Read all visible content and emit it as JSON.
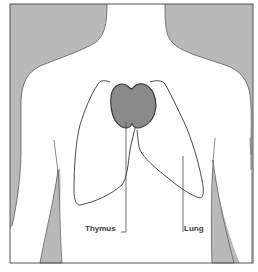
{
  "diagram": {
    "colors": {
      "background_shade": "#b9b9b9",
      "body_fill": "#ffffff",
      "frame_stroke": "#555555",
      "outline_stroke": "#4a4a4a",
      "thymus_fill": "#8a8a8a",
      "thymus_stroke": "#3a3a3a",
      "label_text": "#3a3a3a"
    },
    "labels": {
      "thymus": "Thymus",
      "lung": "Lung"
    }
  }
}
